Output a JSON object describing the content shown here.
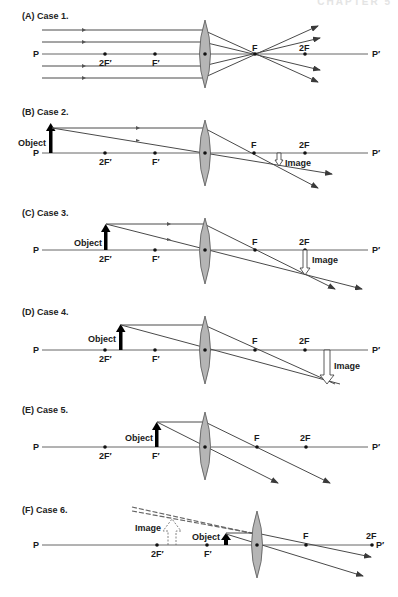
{
  "header": {
    "text": "CHAPTER 5"
  },
  "common": {
    "axis_start": "P",
    "axis_end": "P′",
    "points": {
      "twoFprime": "2F′",
      "Fprime": "F′",
      "F": "F",
      "twoF": "2F"
    },
    "object_label": "Object",
    "image_label": "Image"
  },
  "cases": [
    {
      "id": "A",
      "label": "(A)  Case 1."
    },
    {
      "id": "B",
      "label": "(B)  Case 2."
    },
    {
      "id": "C",
      "label": "(C)  Case 3."
    },
    {
      "id": "D",
      "label": "(D)  Case 4."
    },
    {
      "id": "E",
      "label": "(E)  Case 5."
    },
    {
      "id": "F",
      "label": "(F)  Case 6."
    }
  ],
  "colors": {
    "ray": "#4a4a4a",
    "lens_fill": "#b5b5b5",
    "axis": "#555555"
  }
}
